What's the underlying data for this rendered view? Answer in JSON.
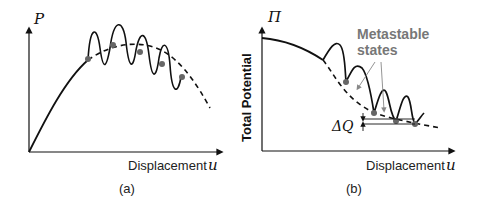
{
  "panels": [
    {
      "id": "a",
      "caption": "(a)",
      "y_axis_label": "P",
      "x_axis_label": "Displacement",
      "x_axis_symbol": "u",
      "description": "Load P vs displacement u: rising loading path, dashed envelope with oscillating (snap-through) solid curve and grey equilibrium dots"
    },
    {
      "id": "b",
      "caption": "(b)",
      "y_axis_symbol": "Π",
      "y_axis_label": "Total Potential",
      "x_axis_label": "Displacement",
      "x_axis_symbol": "u",
      "annotation": "Metastable states",
      "annotation_line1": "Metastable",
      "annotation_line2": "states",
      "delta_label": "ΔQ",
      "description": "Total potential Π vs displacement u: decreasing dashed envelope with energy-barrier bumps and grey metastable minima dots"
    }
  ],
  "colors": {
    "curve": "#111111",
    "dot": "#666666",
    "annotation": "#777777",
    "arrow": "#888888"
  }
}
